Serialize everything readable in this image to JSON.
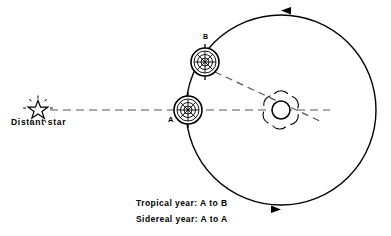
{
  "diagram": {
    "title_implied": "Tropical year versus sidereal year",
    "background_color": "#ffffff",
    "stroke_color": "#000000",
    "labels": {
      "distant_star": "Distant star",
      "point_a": "A",
      "point_b": "B"
    },
    "captions": {
      "tropical": "Tropical year: A to B",
      "sidereal": "Sidereal year: A to A"
    },
    "icons": {
      "star": "star-icon",
      "sun": "sun-icon",
      "planet_a": "globe-icon",
      "planet_b": "globe-icon",
      "orbit_arrow_top": "arrow-left-icon",
      "orbit_arrow_bottom": "arrow-right-icon"
    },
    "geometry": {
      "orbit_center_x": 281,
      "orbit_center_y": 110,
      "orbit_radius": 95,
      "sun_center_x": 281,
      "sun_center_y": 110,
      "sun_radius": 9,
      "planet_a_x": 188,
      "planet_a_y": 110,
      "planet_b_x": 205,
      "planet_b_y": 62,
      "planet_radius": 14,
      "star_x": 38,
      "star_y": 108,
      "orbit_direction": "counterclockwise"
    }
  }
}
